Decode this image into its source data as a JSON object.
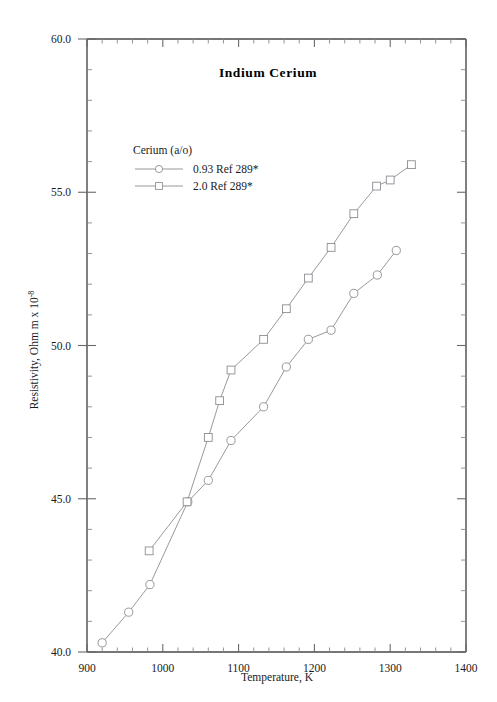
{
  "chart_data": {
    "type": "line",
    "title": "Indium  Cerium",
    "xlabel": "Temperature,  K",
    "ylabel": "Resistivity, Ohm m x 10",
    "ylabel_exponent": "-8",
    "xlim": [
      900,
      1400
    ],
    "ylim": [
      40.0,
      60.0
    ],
    "x_major_ticks": [
      900,
      1000,
      1100,
      1200,
      1300,
      1400
    ],
    "x_tick_labels": [
      "900",
      "1000",
      "1100",
      "1200",
      "1300",
      "1400"
    ],
    "x_minor_step": 20,
    "y_major_ticks": [
      40.0,
      45.0,
      50.0,
      55.0,
      60.0
    ],
    "y_tick_labels": [
      "40.0",
      "45.0",
      "50.0",
      "55.0",
      "60.0"
    ],
    "y_minor_step": 1.0,
    "grid": false,
    "legend_position": "upper-left",
    "legend_title": "Cerium (a/o)",
    "series": [
      {
        "name": "0.93 Ref 289*",
        "marker": "circle",
        "color": "#8d8d93",
        "points": [
          [
            920,
            40.3
          ],
          [
            955,
            41.3
          ],
          [
            983,
            42.2
          ],
          [
            1033,
            44.9
          ],
          [
            1060,
            45.6
          ],
          [
            1090,
            46.9
          ],
          [
            1133,
            48.0
          ],
          [
            1163,
            49.3
          ],
          [
            1192,
            50.2
          ],
          [
            1222,
            50.5
          ],
          [
            1252,
            51.7
          ],
          [
            1283,
            52.3
          ],
          [
            1308,
            53.1
          ]
        ]
      },
      {
        "name": "2.0 Ref 289*",
        "marker": "square",
        "color": "#8d8d93",
        "points": [
          [
            982,
            43.3
          ],
          [
            1032,
            44.9
          ],
          [
            1060,
            47.0
          ],
          [
            1075,
            48.2
          ],
          [
            1090,
            49.2
          ],
          [
            1133,
            50.2
          ],
          [
            1163,
            51.2
          ],
          [
            1192,
            52.2
          ],
          [
            1222,
            53.2
          ],
          [
            1252,
            54.3
          ],
          [
            1282,
            55.2
          ],
          [
            1300,
            55.4
          ],
          [
            1328,
            55.9
          ]
        ]
      }
    ]
  }
}
